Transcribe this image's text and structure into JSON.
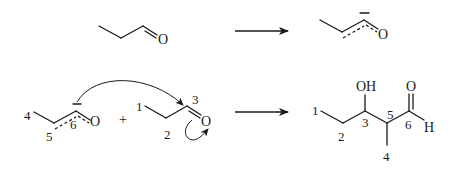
{
  "diagram": {
    "row1": {
      "reactant": {
        "name": "propanal",
        "atoms": {
          "oxygen": "O"
        }
      },
      "arrow": "reaction-arrow",
      "product": {
        "name": "enolate",
        "atoms": {
          "oxygen": "O"
        },
        "charge_mark": "–"
      }
    },
    "row2": {
      "nucleophile": {
        "name": "enolate",
        "atoms": {
          "oxygen": "O"
        },
        "numbers": {
          "c4": "4",
          "c5": "5",
          "c6": "6"
        }
      },
      "plus": "+",
      "electrophile": {
        "name": "propanal",
        "atoms": {
          "oxygen": "O"
        },
        "numbers": {
          "c1": "1",
          "c2": "2",
          "c3": "3"
        }
      },
      "arrow": "reaction-arrow",
      "product": {
        "name": "3-hydroxy-2-methylpentanal",
        "atoms": {
          "hydroxyl": "OH",
          "oxygen": "O",
          "hydrogen": "H"
        },
        "numbers": {
          "c1": "1",
          "c2": "2",
          "c3": "3",
          "c4": "4",
          "c5": "5",
          "c6": "6"
        }
      }
    }
  }
}
